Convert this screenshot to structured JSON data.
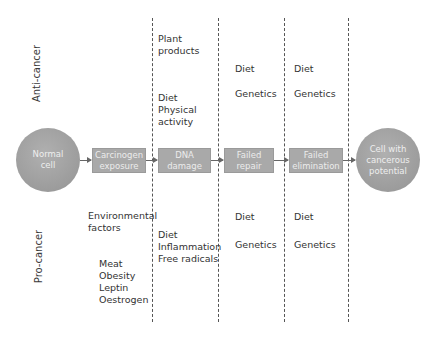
{
  "rows": {
    "anti_label": "Anti-cancer",
    "pro_label": "Pro-cancer"
  },
  "stages": {
    "start": "Normal cell",
    "start_lines": [
      "Normal",
      "cell"
    ],
    "steps": [
      {
        "lines": [
          "Carcinogen",
          "exposure"
        ]
      },
      {
        "lines": [
          "DNA",
          "damage"
        ]
      },
      {
        "lines": [
          "Failed",
          "repair"
        ]
      },
      {
        "lines": [
          "Failed",
          "elimination"
        ]
      }
    ],
    "end_lines": [
      "Cell with",
      "cancerous",
      "potential"
    ]
  },
  "anti_cancer": {
    "dna_damage_top": [
      "Plant",
      "products"
    ],
    "dna_damage_bottom": [
      "Diet",
      "Physical",
      "activity"
    ],
    "failed_repair": [
      "Diet",
      "Genetics"
    ],
    "failed_elimination": [
      "Diet",
      "Genetics"
    ]
  },
  "pro_cancer": {
    "carcinogen_top": [
      "Environmental",
      "factors"
    ],
    "carcinogen_bottom": [
      "Meat",
      "Obesity",
      "Leptin",
      "Oestrogen"
    ],
    "dna_damage": [
      "Diet",
      "Inflammation",
      "Free radicals"
    ],
    "failed_repair": [
      "Diet",
      "Genetics"
    ],
    "failed_elimination": [
      "Diet",
      "Genetics"
    ]
  },
  "colors": {
    "node_fill": "#a9a9a9",
    "node_text": "#ececec",
    "line": "#555555",
    "text": "#333333"
  }
}
